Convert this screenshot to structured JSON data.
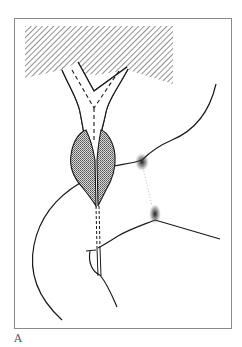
{
  "figure": {
    "panel_label": "A",
    "frame": {
      "x": 14,
      "y": 18,
      "width": 217,
      "height": 310,
      "stroke": "#888888"
    },
    "colors": {
      "line": "#1a1a1a",
      "hatch": "#555555",
      "gland_fill": "#9a9a9a",
      "stipple": "#333333",
      "background": "#ffffff"
    },
    "elements": [
      {
        "name": "hatched-block",
        "description": "diagonally hatched rectangular region at top"
      },
      {
        "name": "y-shaped-duct",
        "description": "Y-shaped tubular structure with dashed centerline"
      },
      {
        "name": "paired-glands",
        "description": "two shaded lobes surrounding the duct"
      },
      {
        "name": "left-curve",
        "description": "long curved contour on left side"
      },
      {
        "name": "right-upper-curve",
        "description": "curved contour from upper right meeting stippled point"
      },
      {
        "name": "right-lower-line",
        "description": "line from stippled point toward lower right"
      },
      {
        "name": "stippled-points",
        "description": "two dotted/stippled convergence points"
      },
      {
        "name": "lower-loop",
        "description": "small curved loop at base of duct"
      }
    ]
  }
}
